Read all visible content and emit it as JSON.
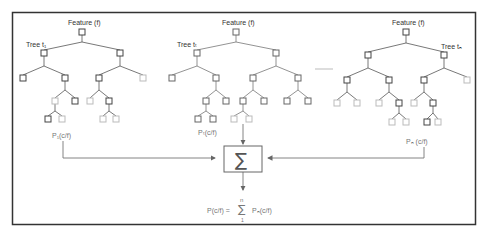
{
  "diagram": {
    "colors": {
      "border": "#333333",
      "edge": "#555555",
      "node_dark": "#444444",
      "node_light": "#bbbbbb",
      "arrow": "#666666",
      "dash": "#aaaaaa"
    },
    "trees": [
      {
        "id": "tree-1",
        "feature_label": "Feature (f)",
        "tree_label": "Tree t₁",
        "prob_label": "P₁(c/f)"
      },
      {
        "id": "tree-t",
        "feature_label": "Feature (f)",
        "tree_label": "Tree tₜ",
        "prob_label": "Pₜ(c/f)"
      },
      {
        "id": "tree-n",
        "feature_label": "Feature (f)",
        "tree_label": "Tree tₙ",
        "prob_label": "Pₙ (c/f)"
      }
    ],
    "aggregator": {
      "symbol": "∑",
      "label": "Summation"
    },
    "formula": {
      "lhs": "P(c/f) =",
      "sum_upper": "n",
      "sum_symbol": "∑",
      "sum_lower": "1",
      "rhs": "Pₙ(c/f)"
    },
    "ellipsis": "......"
  }
}
